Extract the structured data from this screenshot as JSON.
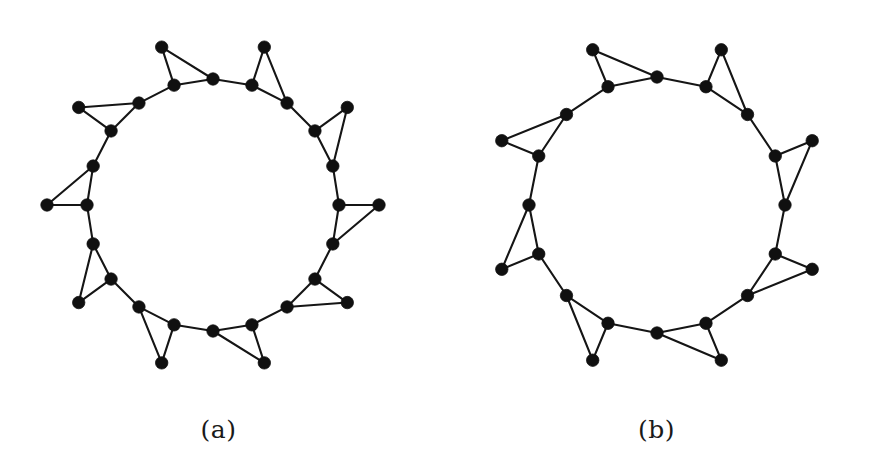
{
  "page": {
    "background_color": "#ffffff",
    "width": 875,
    "height": 466
  },
  "style": {
    "edge_color": "#151515",
    "vertex_color": "#101010",
    "edge_width": 2.1,
    "vertex_radius": 6.2,
    "caption_color": "#1a1a1a"
  },
  "figures": [
    {
      "id": "figure-a",
      "caption": "(a)",
      "center": [
        213,
        210
      ],
      "n_spokes": 10,
      "inner_radius": 126,
      "outer_radius": 166,
      "start_angle_deg": -90,
      "inner_vertex_count": 10,
      "outer_vertex_count": 10,
      "vertex_count": 20,
      "edge_count": 30,
      "inner_vertices": [
        [
          213,
          84
        ],
        [
          287,
          138
        ],
        [
          315,
          225
        ],
        [
          287,
          312
        ],
        [
          213,
          366
        ],
        [
          139,
          312
        ],
        [
          111,
          225
        ],
        [
          139,
          138
        ]
      ],
      "outer_vertices": [
        [
          213,
          34
        ],
        [
          377,
          155
        ],
        [
          377,
          265
        ],
        [
          213,
          385
        ],
        [
          48,
          265
        ],
        [
          48,
          155
        ]
      ],
      "triangle_spike_count": 5,
      "description": "Star polygon graph with ten inner ring vertices and ten outer vertices forming five triangular spikes"
    },
    {
      "id": "figure-b",
      "caption": "(b)",
      "center": [
        670,
        210
      ],
      "n_spokes": 8,
      "inner_radius": 128,
      "outer_radius": 168,
      "start_angle_deg": -90,
      "inner_vertex_count": 8,
      "outer_vertex_count": 8,
      "vertex_count": 16,
      "edge_count": 24,
      "inner_vertices": [
        [
          670,
          82
        ],
        [
          760,
          120
        ],
        [
          798,
          210
        ],
        [
          760,
          300
        ],
        [
          670,
          338
        ],
        [
          580,
          300
        ],
        [
          542,
          210
        ],
        [
          580,
          120
        ]
      ],
      "outer_vertices": [
        [
          670,
          33
        ],
        [
          838,
          155
        ],
        [
          838,
          265
        ],
        [
          670,
          385
        ],
        [
          502,
          265
        ],
        [
          502,
          155
        ]
      ],
      "triangle_spike_count": 4,
      "description": "Star polygon graph with eight inner ring vertices and eight outer vertices forming four triangular spikes"
    }
  ],
  "chart_data": {
    "type": "diagram",
    "subtype": "graph-drawing",
    "title": "",
    "graphs": [
      {
        "label": "(a)",
        "vertices": 20,
        "edges": 30,
        "layout": "two concentric rings, star polygon",
        "node_ring_inner": 10,
        "node_ring_outer": 10,
        "node_positions": [
          {
            "id": "i0",
            "x": 213,
            "y": 84
          },
          {
            "id": "i1",
            "x": 260,
            "y": 99
          },
          {
            "id": "i2",
            "x": 296,
            "y": 132
          },
          {
            "id": "i3",
            "x": 313,
            "y": 178
          },
          {
            "id": "i4",
            "x": 313,
            "y": 242
          },
          {
            "id": "i5",
            "x": 296,
            "y": 288
          },
          {
            "id": "i6",
            "x": 260,
            "y": 321
          },
          {
            "id": "i7",
            "x": 213,
            "y": 336
          },
          {
            "id": "i8",
            "x": 166,
            "y": 321
          },
          {
            "id": "i9",
            "x": 130,
            "y": 288
          },
          {
            "id": "i10",
            "x": 113,
            "y": 242
          },
          {
            "id": "i11",
            "x": 113,
            "y": 178
          },
          {
            "id": "i12",
            "x": 130,
            "y": 132
          },
          {
            "id": "i13",
            "x": 166,
            "y": 99
          },
          {
            "id": "o0",
            "x": 213,
            "y": 34
          },
          {
            "id": "o1",
            "x": 377,
            "y": 155
          },
          {
            "id": "o2",
            "x": 377,
            "y": 265
          },
          {
            "id": "o3",
            "x": 213,
            "y": 385
          },
          {
            "id": "o4",
            "x": 48,
            "y": 265
          },
          {
            "id": "o5",
            "x": 48,
            "y": 155
          }
        ]
      },
      {
        "label": "(b)",
        "vertices": 16,
        "edges": 24,
        "layout": "two concentric rings, star polygon",
        "node_ring_inner": 8,
        "node_ring_outer": 8,
        "node_positions": [
          {
            "id": "i0",
            "x": 670,
            "y": 82
          },
          {
            "id": "i1",
            "x": 760,
            "y": 120
          },
          {
            "id": "i2",
            "x": 798,
            "y": 210
          },
          {
            "id": "i3",
            "x": 760,
            "y": 300
          },
          {
            "id": "i4",
            "x": 670,
            "y": 338
          },
          {
            "id": "i5",
            "x": 580,
            "y": 300
          },
          {
            "id": "i6",
            "x": 542,
            "y": 210
          },
          {
            "id": "i7",
            "x": 580,
            "y": 120
          },
          {
            "id": "o0",
            "x": 670,
            "y": 33
          },
          {
            "id": "o1",
            "x": 838,
            "y": 155
          },
          {
            "id": "o2",
            "x": 838,
            "y": 265
          },
          {
            "id": "o3",
            "x": 670,
            "y": 385
          },
          {
            "id": "o4",
            "x": 502,
            "y": 265
          },
          {
            "id": "o5",
            "x": 502,
            "y": 155
          }
        ]
      }
    ]
  }
}
